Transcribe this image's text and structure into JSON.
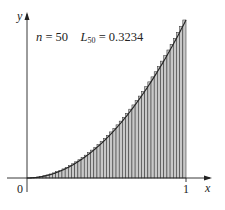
{
  "figure": {
    "annotation": {
      "n_label": "n",
      "n_eq": " = 50",
      "L_label": "L",
      "L_sub": "50",
      "L_eq": " = 0.3234"
    },
    "axes": {
      "x_label": "x",
      "y_label": "y",
      "origin_label": "0",
      "x_tick_label": "1"
    },
    "colors": {
      "axis": "#222222",
      "curve": "#222222",
      "strip_fill": "#c8c8c8",
      "strip_line": "#333333",
      "background": "#ffffff"
    }
  },
  "chart_data": {
    "type": "area",
    "title": "",
    "function": "y = x^2",
    "method": "left-endpoint Riemann sum",
    "n": 50,
    "L_50": 0.3234,
    "xlabel": "x",
    "ylabel": "y",
    "xlim": [
      0,
      1
    ],
    "ylim": [
      0,
      1
    ],
    "x_ticks": [
      "0",
      "1"
    ],
    "grid": false
  }
}
